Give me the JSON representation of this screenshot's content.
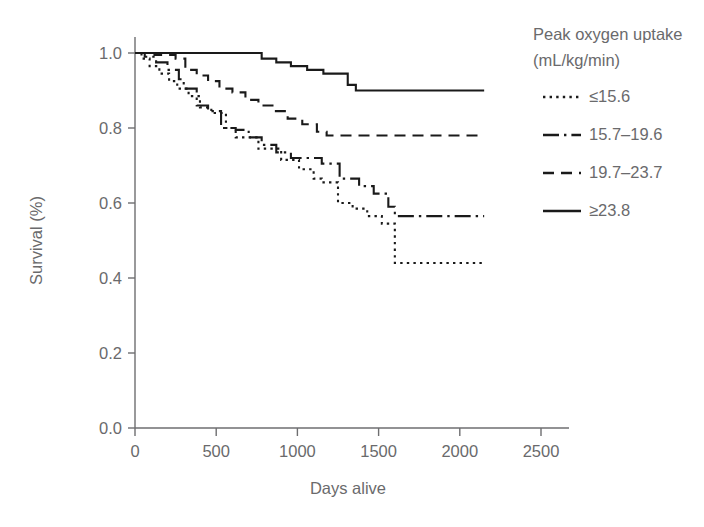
{
  "figure": {
    "kind": "kaplan-meier-survival-plot",
    "background": "#ffffff",
    "ink_color": "#1a1a1a",
    "text_color": "#6a6a6c"
  },
  "axes": {
    "x_title": "Days alive",
    "y_title": "Survival (%)",
    "x_ticks": [
      "0",
      "500",
      "1000",
      "1500",
      "2000",
      "2500"
    ],
    "y_ticks": [
      "0.0",
      "0.2",
      "0.4",
      "0.6",
      "0.8",
      "1.0"
    ]
  },
  "legend": {
    "title_line1": "Peak oxygen uptake",
    "title_line2": "(mL/kg/min)",
    "entries": [
      {
        "label": "≤15.6",
        "style": "dotted"
      },
      {
        "label": "15.7–19.6",
        "style": "dash-dot"
      },
      {
        "label": "19.7–23.7",
        "style": "dashed"
      },
      {
        "label": "≥23.8",
        "style": "solid"
      }
    ]
  },
  "chart_data": {
    "type": "line",
    "subtype": "step-post (Kaplan-Meier survival curves)",
    "title": "",
    "subtitle": "",
    "xlabel": "Days alive",
    "ylabel": "Survival (%)",
    "xlim": [
      0,
      2500
    ],
    "ylim": [
      0.0,
      1.0
    ],
    "xticks": [
      0,
      500,
      1000,
      1500,
      2000,
      2500
    ],
    "yticks": [
      0.0,
      0.2,
      0.4,
      0.6,
      0.8,
      1.0
    ],
    "grid": false,
    "legend_position": "right-outside-top",
    "legend_title": "Peak oxygen uptake (mL/kg/min)",
    "series": [
      {
        "name": "≤15.6",
        "style": "dotted",
        "x": [
          0,
          40,
          90,
          150,
          210,
          260,
          330,
          400,
          470,
          560,
          620,
          700,
          760,
          900,
          1010,
          1100,
          1150,
          1250,
          1340,
          1430,
          1520,
          1600,
          2150
        ],
        "y": [
          1.0,
          0.985,
          0.965,
          0.945,
          0.925,
          0.905,
          0.885,
          0.855,
          0.84,
          0.8,
          0.775,
          0.775,
          0.745,
          0.715,
          0.69,
          0.665,
          0.655,
          0.6,
          0.585,
          0.565,
          0.545,
          0.44,
          0.44
        ],
        "final_value": 0.44
      },
      {
        "name": "15.7–19.6",
        "style": "dash-dot",
        "x": [
          0,
          60,
          130,
          200,
          270,
          300,
          380,
          450,
          530,
          620,
          700,
          780,
          870,
          960,
          1050,
          1150,
          1260,
          1380,
          1470,
          1560,
          1600,
          2150
        ],
        "y": [
          1.0,
          0.99,
          0.975,
          0.955,
          0.93,
          0.905,
          0.86,
          0.845,
          0.8,
          0.795,
          0.775,
          0.755,
          0.735,
          0.72,
          0.72,
          0.705,
          0.665,
          0.645,
          0.625,
          0.59,
          0.565,
          0.565
        ],
        "final_value": 0.565
      },
      {
        "name": "19.7–23.7",
        "style": "dashed",
        "x": [
          0,
          120,
          250,
          310,
          380,
          450,
          520,
          600,
          680,
          760,
          860,
          940,
          1030,
          1120,
          1180,
          2150
        ],
        "y": [
          1.0,
          0.995,
          0.985,
          0.955,
          0.94,
          0.925,
          0.905,
          0.895,
          0.875,
          0.86,
          0.845,
          0.825,
          0.81,
          0.79,
          0.78,
          0.78
        ],
        "final_value": 0.78
      },
      {
        "name": "≥23.8",
        "style": "solid",
        "x": [
          0,
          700,
          780,
          870,
          960,
          1060,
          1160,
          1250,
          1310,
          1360,
          2150
        ],
        "y": [
          1.0,
          1.0,
          0.985,
          0.975,
          0.965,
          0.955,
          0.945,
          0.945,
          0.915,
          0.9,
          0.9
        ],
        "final_value": 0.9
      }
    ]
  }
}
